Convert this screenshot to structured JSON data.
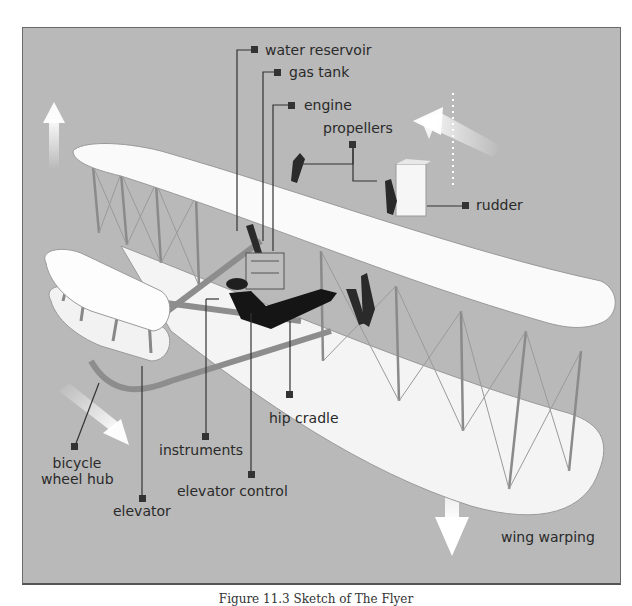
{
  "figure": {
    "title": "Sketch of The Flyer",
    "caption": "Figure 11.3 Sketch of The Flyer",
    "background_color": "#b9b9b9",
    "labels": {
      "water_reservoir": "water reservoir",
      "gas_tank": "gas tank",
      "engine": "engine",
      "propellers": "propellers",
      "rudder": "rudder",
      "hip_cradle": "hip cradle",
      "instruments": "instruments",
      "elevator_control": "elevator control",
      "bicycle_wheel_hub_line1": "bicycle",
      "bicycle_wheel_hub_line2": "wheel hub",
      "elevator": "elevator",
      "wing_warping": "wing warping"
    },
    "arrows": [
      "up-arrow-left",
      "up-left-arrow-right",
      "down-right-arrow-left",
      "down-arrow-bottom",
      "dotted-yaw-axis"
    ]
  }
}
